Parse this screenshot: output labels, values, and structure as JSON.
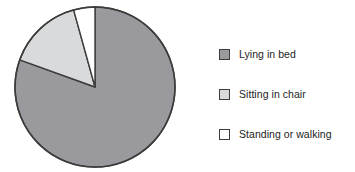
{
  "chart_data": {
    "type": "pie",
    "title": "",
    "categories": [
      "Lying in bed",
      "Sitting in chair",
      "Standing or walking"
    ],
    "values": [
      80.5,
      15.2,
      4.3
    ],
    "units": "percent",
    "start_angle_deg": 0,
    "direction": "clockwise",
    "legend_position": "right",
    "grid": false,
    "slices": [
      {
        "label": "Lying in bed",
        "value": 80.5,
        "color": "#9a9a9e",
        "start_deg": 0,
        "end_deg": 289.8
      },
      {
        "label": "Sitting in chair",
        "value": 15.2,
        "color": "#d8dadb",
        "start_deg": 289.8,
        "end_deg": 344.5
      },
      {
        "label": "Standing or walking",
        "value": 4.3,
        "color": "#ffffff",
        "start_deg": 344.5,
        "end_deg": 360
      }
    ]
  },
  "legend": {
    "items": [
      {
        "label": "Lying in bed",
        "color": "#9a9a9e",
        "swatch": "legend-swatch-dark-gray"
      },
      {
        "label": "Sitting in chair",
        "color": "#d8dadb",
        "swatch": "legend-swatch-light-gray"
      },
      {
        "label": "Standing or walking",
        "color": "#ffffff",
        "swatch": "legend-swatch-white"
      }
    ]
  },
  "style": {
    "background": "#ffffff",
    "outline": "#3c3c3c",
    "text": "#1d1d1d"
  },
  "geometry": {
    "center_x": 95,
    "center_y": 87,
    "radius": 80
  }
}
